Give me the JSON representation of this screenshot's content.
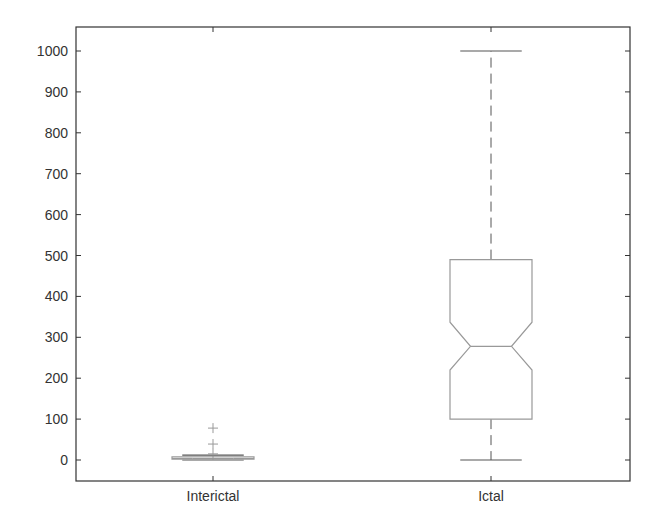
{
  "chart_data": {
    "type": "boxplot",
    "title": "",
    "xlabel": "",
    "ylabel": "",
    "ylim": [
      -50,
      1050
    ],
    "yticks": [
      0,
      100,
      200,
      300,
      400,
      500,
      600,
      700,
      800,
      900,
      1000
    ],
    "grid": false,
    "legend": null,
    "notched": true,
    "categories": [
      "Interictal",
      "Ictal"
    ],
    "series": [
      {
        "name": "Interictal",
        "whisker_low": 0,
        "q1": 2,
        "median": 4,
        "q3": 8,
        "whisker_high": 12,
        "outliers": [
          15,
          39,
          78
        ]
      },
      {
        "name": "Ictal",
        "whisker_low": 0,
        "q1": 100,
        "notch_low": 220,
        "median": 278,
        "notch_high": 337,
        "q3": 490,
        "whisker_high": 1000,
        "outliers": []
      }
    ]
  },
  "colors": {
    "axis": "#333333",
    "box": "#999999",
    "whisker": "#555555",
    "outlier": "#999999",
    "text": "#333333"
  }
}
